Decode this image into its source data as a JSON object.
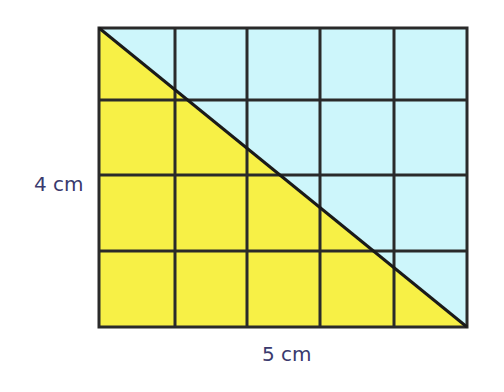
{
  "diagram": {
    "type": "grid-rectangle-with-diagonal",
    "columns": 5,
    "rows": 4,
    "width_label": "5 cm",
    "height_label": "4 cm",
    "colors": {
      "upper_triangle": "#cdf6fb",
      "lower_triangle": "#f7f046",
      "grid_line": "#2a2a2a",
      "label": "#3a3a6e"
    }
  }
}
